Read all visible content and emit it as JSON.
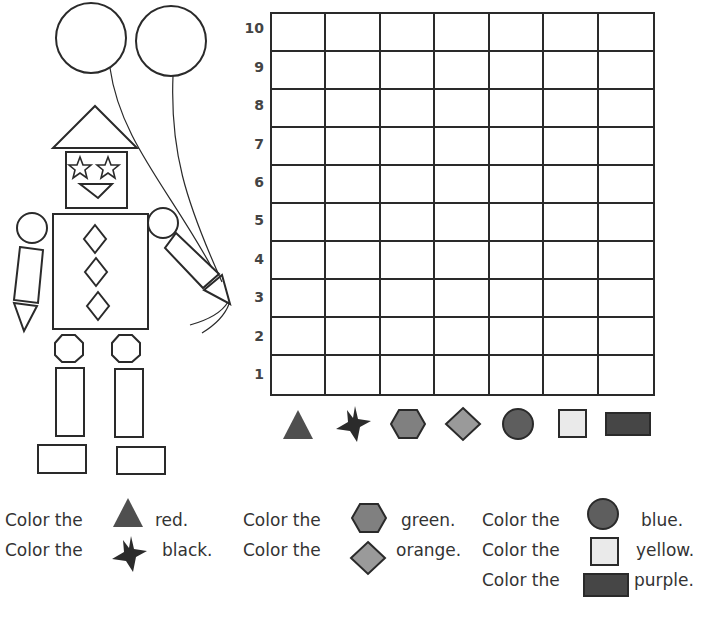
{
  "worksheet": {
    "grid": {
      "row_labels": [
        "10",
        "9",
        "8",
        "7",
        "6",
        "5",
        "4",
        "3",
        "2",
        "1"
      ],
      "columns": 7,
      "rows": 10,
      "column_shapes": [
        "triangle",
        "star",
        "hexagon",
        "diamond",
        "circle",
        "square",
        "rectangle"
      ]
    },
    "instructions": [
      {
        "prefix": "Color the",
        "shape": "triangle",
        "color_word": "red."
      },
      {
        "prefix": "Color the",
        "shape": "star",
        "color_word": "black."
      },
      {
        "prefix": "Color the",
        "shape": "hexagon",
        "color_word": "green."
      },
      {
        "prefix": "Color the",
        "shape": "diamond",
        "color_word": "orange."
      },
      {
        "prefix": "Color the",
        "shape": "circle",
        "color_word": "blue."
      },
      {
        "prefix": "Color the",
        "shape": "square",
        "color_word": "yellow."
      },
      {
        "prefix": "Color the",
        "shape": "rectangle",
        "color_word": "purple."
      }
    ],
    "shape_fills": {
      "triangle": "#4f4f4f",
      "star": "#2b2b2b",
      "hexagon": "#808080",
      "diamond": "#9a9a9a",
      "circle": "#5e5e5e",
      "square": "#eaeaea",
      "rectangle": "#464646"
    },
    "line_color": "#2a2a2a"
  }
}
